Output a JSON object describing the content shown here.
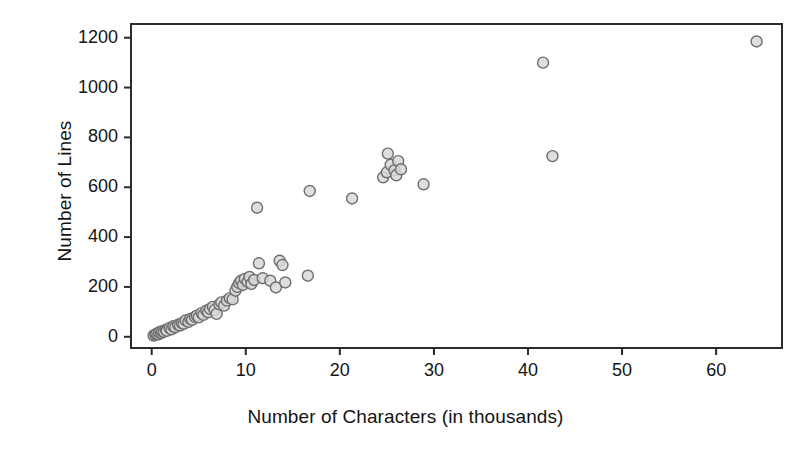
{
  "chart_data": {
    "type": "scatter",
    "title": "",
    "xlabel": "Number of Characters (in thousands)",
    "ylabel": "Number of Lines",
    "xlim": [
      -2.2,
      67.0
    ],
    "ylim": [
      -45,
      1255
    ],
    "xticks": [
      0,
      10,
      20,
      30,
      40,
      50,
      60
    ],
    "yticks": [
      0,
      200,
      400,
      600,
      800,
      1000,
      1200
    ],
    "xticklabels": [
      "0",
      "10",
      "20",
      "30",
      "40",
      "50",
      "60"
    ],
    "yticklabels": [
      "0",
      "200",
      "400",
      "600",
      "800",
      "1000",
      "1200"
    ],
    "grid": false,
    "legend": null,
    "marker": {
      "shape": "circle",
      "size_px": 11,
      "fill": "#d8d8d8",
      "edge": "#6e6e6e",
      "opacity": 0.85
    },
    "frame": {
      "box": true,
      "color": "#2b2b2b",
      "x_tick_direction": "out",
      "y_tick_direction": "out"
    },
    "n_points": 72,
    "points": [
      [
        0.2,
        5
      ],
      [
        0.4,
        8
      ],
      [
        0.5,
        12
      ],
      [
        0.7,
        10
      ],
      [
        0.8,
        18
      ],
      [
        1.0,
        15
      ],
      [
        1.1,
        22
      ],
      [
        1.3,
        20
      ],
      [
        1.5,
        28
      ],
      [
        1.6,
        24
      ],
      [
        1.9,
        35
      ],
      [
        2.1,
        30
      ],
      [
        2.3,
        42
      ],
      [
        2.5,
        38
      ],
      [
        2.8,
        48
      ],
      [
        3.0,
        45
      ],
      [
        3.2,
        55
      ],
      [
        3.4,
        52
      ],
      [
        3.6,
        66
      ],
      [
        3.9,
        60
      ],
      [
        4.1,
        72
      ],
      [
        4.3,
        68
      ],
      [
        4.6,
        80
      ],
      [
        4.8,
        85
      ],
      [
        5.0,
        78
      ],
      [
        5.3,
        95
      ],
      [
        5.5,
        88
      ],
      [
        5.8,
        105
      ],
      [
        6.0,
        98
      ],
      [
        6.2,
        112
      ],
      [
        6.5,
        120
      ],
      [
        6.7,
        108
      ],
      [
        6.9,
        92
      ],
      [
        7.2,
        130
      ],
      [
        7.4,
        138
      ],
      [
        7.7,
        125
      ],
      [
        8.0,
        145
      ],
      [
        8.3,
        155
      ],
      [
        8.6,
        150
      ],
      [
        8.9,
        185
      ],
      [
        9.1,
        200
      ],
      [
        9.3,
        215
      ],
      [
        9.5,
        225
      ],
      [
        9.7,
        208
      ],
      [
        9.9,
        232
      ],
      [
        10.2,
        220
      ],
      [
        10.4,
        240
      ],
      [
        10.6,
        212
      ],
      [
        10.9,
        228
      ],
      [
        11.2,
        518
      ],
      [
        11.4,
        295
      ],
      [
        11.8,
        235
      ],
      [
        12.6,
        225
      ],
      [
        13.2,
        198
      ],
      [
        13.6,
        305
      ],
      [
        13.9,
        288
      ],
      [
        14.2,
        218
      ],
      [
        16.6,
        245
      ],
      [
        16.8,
        585
      ],
      [
        21.3,
        555
      ],
      [
        24.6,
        640
      ],
      [
        25.0,
        660
      ],
      [
        25.1,
        735
      ],
      [
        25.4,
        690
      ],
      [
        25.8,
        668
      ],
      [
        26.0,
        648
      ],
      [
        26.2,
        705
      ],
      [
        26.5,
        672
      ],
      [
        28.9,
        612
      ],
      [
        41.6,
        1100
      ],
      [
        42.6,
        725
      ],
      [
        64.3,
        1185
      ]
    ]
  },
  "axis_titles": {
    "x": "Number of Characters (in thousands)",
    "y": "Number of Lines"
  }
}
